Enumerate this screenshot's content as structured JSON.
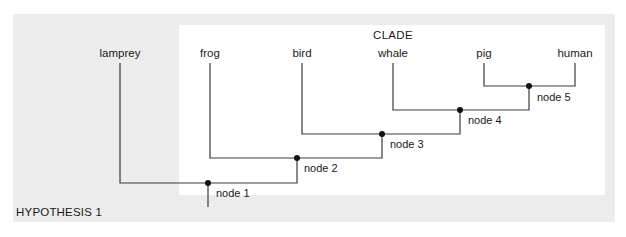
{
  "diagram": {
    "clade_label": "CLADE",
    "hypothesis_label": "HYPOTHESIS 1",
    "colors": {
      "outer_panel": "#ececec",
      "clade_panel": "#ffffff",
      "lines": "#3a3a3a"
    },
    "taxa": [
      {
        "label": "lamprey"
      },
      {
        "label": "frog"
      },
      {
        "label": "bird"
      },
      {
        "label": "whale"
      },
      {
        "label": "pig"
      },
      {
        "label": "human"
      }
    ],
    "nodes": [
      {
        "label": "node 1"
      },
      {
        "label": "node 2"
      },
      {
        "label": "node 3"
      },
      {
        "label": "node 4"
      },
      {
        "label": "node 5"
      }
    ]
  }
}
